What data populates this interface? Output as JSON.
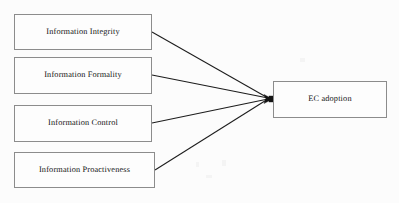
{
  "diagram": {
    "background_color": "#fcfcfc",
    "box_border_color": "#8c8c8c",
    "line_color": "#1c1c1c",
    "antecedents": [
      {
        "id": "information-integrity",
        "label": "Information Integrity"
      },
      {
        "id": "information-formality",
        "label": "Information Formality"
      },
      {
        "id": "information-control",
        "label": "Information Control"
      },
      {
        "id": "information-proactiveness",
        "label": "Information Proactiveness"
      }
    ],
    "outcome": {
      "id": "ec-adoption",
      "label": "EC adoption"
    },
    "edges": [
      {
        "from": "Information Integrity",
        "to": "EC adoption",
        "style": "solid",
        "arrow": "single"
      },
      {
        "from": "Information Formality",
        "to": "EC adoption",
        "style": "solid",
        "arrow": "single"
      },
      {
        "from": "Information Control",
        "to": "EC adoption",
        "style": "solid",
        "arrow": "single"
      },
      {
        "from": "Information Proactiveness",
        "to": "EC adoption",
        "style": "solid",
        "arrow": "single"
      }
    ]
  }
}
